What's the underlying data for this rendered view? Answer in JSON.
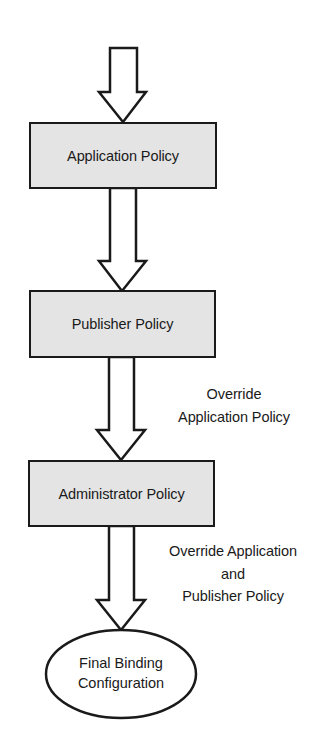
{
  "diagram": {
    "type": "flowchart",
    "direction": "top-to-bottom",
    "colors": {
      "box_fill": "#e4e4e4",
      "stroke": "#1a1a1a",
      "background": "#ffffff",
      "arrow_fill": "#ffffff"
    },
    "nodes": [
      {
        "id": "application-policy",
        "shape": "rectangle",
        "label": "Application Policy"
      },
      {
        "id": "publisher-policy",
        "shape": "rectangle",
        "label": "Publisher Policy"
      },
      {
        "id": "administrator-policy",
        "shape": "rectangle",
        "label": "Administrator Policy"
      },
      {
        "id": "final-binding-configuration",
        "shape": "ellipse",
        "label_lines": [
          "Final Binding",
          "Configuration"
        ]
      }
    ],
    "edges": [
      {
        "from": "entry",
        "to": "application-policy",
        "label_lines": []
      },
      {
        "from": "application-policy",
        "to": "publisher-policy",
        "label_lines": []
      },
      {
        "from": "publisher-policy",
        "to": "administrator-policy",
        "label_lines": [
          "Override",
          "Application Policy"
        ]
      },
      {
        "from": "administrator-policy",
        "to": "final-binding-configuration",
        "label_lines": [
          "Override Application",
          "and",
          "Publisher Policy"
        ]
      }
    ]
  }
}
